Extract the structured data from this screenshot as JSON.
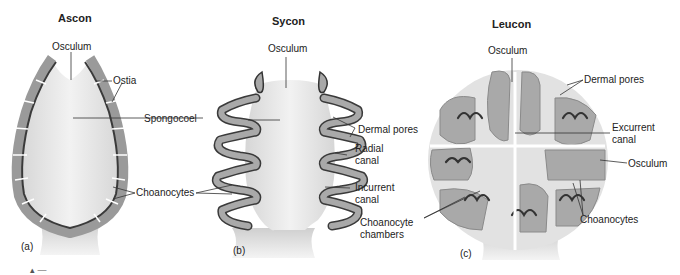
{
  "diagram": {
    "type": "sponge-body-plans",
    "panels": [
      {
        "id": "a",
        "title": "Ascon",
        "letter": "(a)",
        "labels": [
          "Osculum",
          "Ostia",
          "Spongocoel",
          "Choanocytes"
        ]
      },
      {
        "id": "b",
        "title": "Sycon",
        "letter": "(b)",
        "labels": [
          "Osculum",
          "Dermal pores",
          "Radial canal",
          "Incurrent canal"
        ]
      },
      {
        "id": "c",
        "title": "Leucon",
        "letter": "(c)",
        "labels": [
          "Osculum",
          "Dermal pores",
          "Excurrent canal",
          "Osculum",
          "Choanocytes",
          "Choanocyte chambers"
        ]
      }
    ],
    "shared_labels": {
      "spongocoel": "Spongocoel",
      "choanocytes": "Choanocytes"
    },
    "colors": {
      "body_fill": "#e4e4e4",
      "cell_fill": "#a9a9a9",
      "cell_stroke": "#555555",
      "choanocyte_layer": "#3a3a3a",
      "leader_line": "#333333"
    },
    "footer_mark": "▴ —"
  }
}
